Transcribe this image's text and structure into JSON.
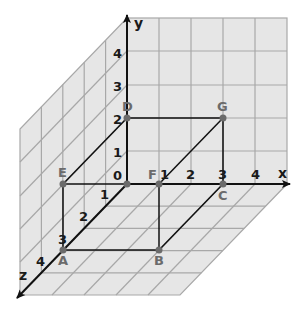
{
  "diagram": {
    "type": "3d-coordinate-system",
    "colors": {
      "plane_fill": "#e6e6e6",
      "grid_line": "#a8a8a8",
      "axis": "#111111",
      "edge": "#111111",
      "point": "#6b6b6b",
      "point_label": "#6b6b6b"
    },
    "axes": {
      "x": {
        "label": "x",
        "ticks": [
          "1",
          "2",
          "3",
          "4"
        ]
      },
      "y": {
        "label": "y",
        "ticks": [
          "1",
          "2",
          "3",
          "4"
        ]
      },
      "z": {
        "label": "z",
        "ticks": [
          "1",
          "2",
          "3",
          "4"
        ]
      },
      "origin_label": "0"
    },
    "points": [
      {
        "name": "O",
        "label": "",
        "coords": [
          0,
          0,
          0
        ]
      },
      {
        "name": "A",
        "label": "A",
        "coords": [
          0,
          0,
          3
        ]
      },
      {
        "name": "B",
        "label": "B",
        "coords": [
          1,
          0,
          3
        ]
      },
      {
        "name": "C",
        "label": "C",
        "coords": [
          3,
          0,
          0
        ]
      },
      {
        "name": "D",
        "label": "D",
        "coords": [
          0,
          2,
          0
        ]
      },
      {
        "name": "E",
        "label": "E",
        "coords": [
          0,
          0,
          3
        ]
      },
      {
        "name": "F",
        "label": "F",
        "coords": [
          1,
          0,
          0
        ]
      },
      {
        "name": "G",
        "label": "G",
        "coords": [
          3,
          2,
          0
        ]
      }
    ],
    "segments": [
      [
        "D",
        "G"
      ],
      [
        "D",
        "E"
      ],
      [
        "E",
        "O"
      ],
      [
        "E",
        "A"
      ],
      [
        "A",
        "B"
      ],
      [
        "F",
        "B"
      ],
      [
        "B",
        "C"
      ],
      [
        "C",
        "G"
      ],
      [
        "F",
        "G"
      ]
    ]
  }
}
